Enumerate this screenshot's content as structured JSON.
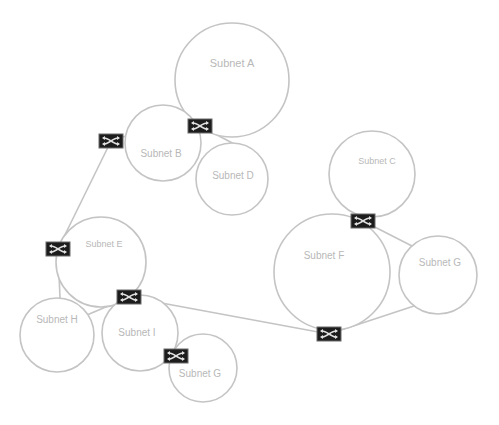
{
  "diagram": {
    "title": "",
    "colors": {
      "background": "#ffffff",
      "circle_stroke": "#c4c4c4",
      "link_stroke": "#c4c4c4",
      "label_text": "#b8b8b8",
      "router_fill": "#1c1c1c",
      "router_glyph": "#e0e0e0"
    },
    "subnets": [
      {
        "id": "A",
        "label": "Subnet A",
        "cx": 232,
        "cy": 80,
        "r": 57,
        "label_x": 232,
        "label_y": 67,
        "font_size": 11
      },
      {
        "id": "B",
        "label": "Subnet B",
        "cx": 163,
        "cy": 143,
        "r": 38,
        "label_x": 161,
        "label_y": 157,
        "font_size": 10
      },
      {
        "id": "D",
        "label": "Subnet D",
        "cx": 232,
        "cy": 179,
        "r": 36,
        "label_x": 233,
        "label_y": 179,
        "font_size": 10
      },
      {
        "id": "C",
        "label": "Subnet C",
        "cx": 372,
        "cy": 174,
        "r": 43,
        "label_x": 377,
        "label_y": 164,
        "font_size": 9
      },
      {
        "id": "F",
        "label": "Subnet F",
        "cx": 332,
        "cy": 272,
        "r": 58,
        "label_x": 324,
        "label_y": 259,
        "font_size": 10
      },
      {
        "id": "G1",
        "label": "Subnet G",
        "cx": 438,
        "cy": 275,
        "r": 39,
        "label_x": 440,
        "label_y": 266,
        "font_size": 10
      },
      {
        "id": "E",
        "label": "Subnet E",
        "cx": 101,
        "cy": 262,
        "r": 45,
        "label_x": 104,
        "label_y": 247,
        "font_size": 9
      },
      {
        "id": "H",
        "label": "Subnet H",
        "cx": 57,
        "cy": 335,
        "r": 37,
        "label_x": 57,
        "label_y": 323,
        "font_size": 10
      },
      {
        "id": "I",
        "label": "Subnet I",
        "cx": 140,
        "cy": 333,
        "r": 38,
        "label_x": 137,
        "label_y": 336,
        "font_size": 10
      },
      {
        "id": "G2",
        "label": "Subnet G",
        "cx": 203,
        "cy": 368,
        "r": 34,
        "label_x": 200,
        "label_y": 377,
        "font_size": 10
      }
    ],
    "routers": [
      {
        "id": "R1",
        "x": 111,
        "y": 141
      },
      {
        "id": "R2",
        "x": 200,
        "y": 126
      },
      {
        "id": "R3",
        "x": 58,
        "y": 249
      },
      {
        "id": "R4",
        "x": 129,
        "y": 297
      },
      {
        "id": "R5",
        "x": 363,
        "y": 221
      },
      {
        "id": "R6",
        "x": 329,
        "y": 334
      },
      {
        "id": "R7",
        "x": 176,
        "y": 356
      }
    ],
    "links": [
      {
        "from": "R1",
        "x1": 111,
        "y1": 141,
        "x2": 129,
        "y2": 135
      },
      {
        "from": "R1",
        "x1": 111,
        "y1": 141,
        "x2": 58,
        "y2": 249
      },
      {
        "from": "R2",
        "x1": 200,
        "y1": 126,
        "x2": 238,
        "y2": 146
      },
      {
        "from": "R3",
        "x1": 58,
        "y1": 249,
        "x2": 60,
        "y2": 298
      },
      {
        "from": "R4",
        "x1": 129,
        "y1": 297,
        "x2": 87,
        "y2": 315
      },
      {
        "from": "R4",
        "x1": 129,
        "y1": 297,
        "x2": 329,
        "y2": 334
      },
      {
        "from": "R5",
        "x1": 363,
        "y1": 221,
        "x2": 412,
        "y2": 246
      },
      {
        "from": "R6",
        "x1": 329,
        "y1": 334,
        "x2": 414,
        "y2": 306
      }
    ]
  }
}
